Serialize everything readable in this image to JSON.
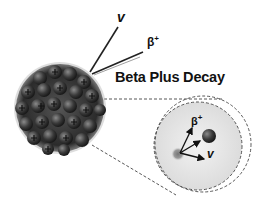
{
  "diagram": {
    "title": "Beta Plus Decay",
    "emission_labels": {
      "neutrino": "v",
      "positron": "β",
      "positron_charge": "+"
    },
    "zoom_labels": {
      "positron": "β",
      "positron_charge": "+",
      "neutrino": "v"
    },
    "nucleus": {
      "description": "nucleus of many nucleons, protons marked with +",
      "proton_symbol": "+"
    },
    "colors": {
      "nucleus": "#3a3a3a",
      "zoom_fill": "#e6e6e6",
      "dashed": "#444444",
      "text": "#111111"
    }
  }
}
